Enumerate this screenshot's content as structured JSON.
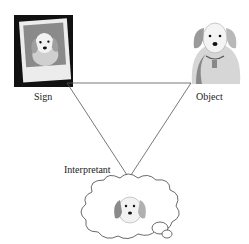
{
  "diagram": {
    "type": "semiotic-triangle",
    "nodes": {
      "sign": {
        "label": "Sign",
        "depiction": "photo of dog in polaroid frame"
      },
      "object": {
        "label": "Object",
        "depiction": "dog illustration"
      },
      "interpretant": {
        "label": "Interpretant",
        "depiction": "dog in thought bubble"
      }
    },
    "edges": [
      {
        "from": "sign",
        "to": "object"
      },
      {
        "from": "object",
        "to": "interpretant"
      },
      {
        "from": "interpretant",
        "to": "sign"
      }
    ],
    "colors": {
      "line": "#555555",
      "frame": "#111111",
      "photo_bg": "#888888",
      "fur": "#e8e8e8",
      "ear": "#9a9a9a"
    }
  }
}
